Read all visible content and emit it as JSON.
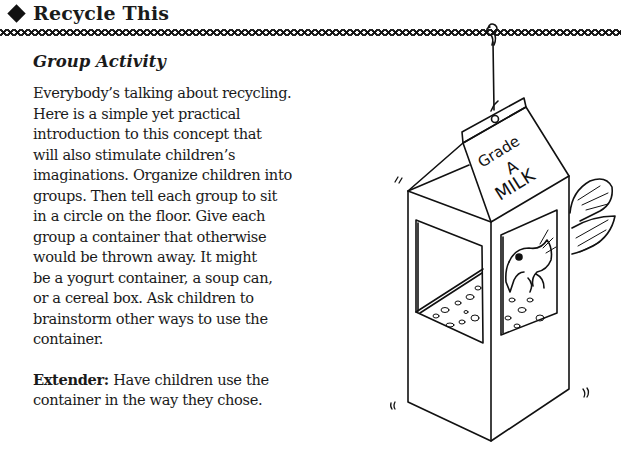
{
  "header": {
    "bullet_icon": "diamond-icon",
    "title": "Recycle This"
  },
  "section": {
    "subheading": "Group Activity",
    "paragraph": "Everybody’s talking about recycling. Here is a simple yet practical introduction to this concept that will also stimulate children’s imaginations. Organize children into groups. Then tell each group to sit in a circle on the floor. Give each group a container that otherwise would be thrown away. It might be a yogurt container, a soup can, or a cereal box. Ask children to brainstorm other ways to use the container.",
    "paragraph_lines": [
      "Everybody’s talking about recycling.",
      "Here is a simple yet practical",
      "introduction to this concept that",
      "will also stimulate children’s",
      "imaginations. Organize children into",
      "groups. Then tell each group to sit",
      "in a circle on the floor. Give each",
      "group a container that otherwise",
      "would be thrown away. It might",
      "be a yogurt container, a soup can,",
      "or a cereal box. Ask children to",
      "brainstorm other ways to use the",
      "container."
    ],
    "extender_label": "Extender:",
    "extender_text": " Have children use the container in the way they chose.",
    "extender_lines": [
      "Extender: Have children use the",
      "container in the way they chose."
    ]
  },
  "illustration": {
    "description": "Milk carton bird feeder hanging from a string with a bird eating seeds",
    "carton_label_line1": "Grade",
    "carton_label_line2": "A",
    "carton_label_line3": "MILK",
    "line_color": "#111111"
  }
}
